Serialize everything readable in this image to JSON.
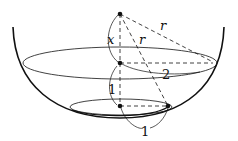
{
  "diagram": {
    "type": "geometry-figure",
    "labels": {
      "x": "x",
      "r_top": "r",
      "r_slant": "r",
      "radius_large": "2",
      "height_between": "1",
      "radius_small": "1"
    },
    "points": [
      {
        "name": "apex",
        "x": 120,
        "y": 14
      },
      {
        "name": "large-circle-center",
        "x": 120,
        "y": 63
      },
      {
        "name": "small-circle-center",
        "x": 120,
        "y": 106
      },
      {
        "name": "small-circle-edge",
        "x": 168,
        "y": 106
      }
    ],
    "colors": {
      "stroke": "#111111",
      "background": "#ffffff"
    }
  }
}
